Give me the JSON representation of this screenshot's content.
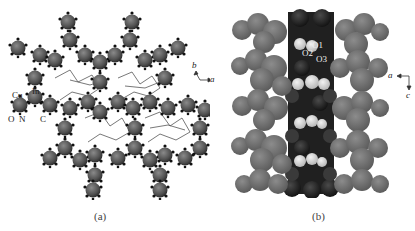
{
  "figure": {
    "panels": [
      {
        "id": "a",
        "caption": "(a)",
        "atom_labels": [
          "Cu",
          "In",
          "O",
          "N",
          "C"
        ],
        "axes": {
          "up": "b",
          "right": "a"
        }
      },
      {
        "id": "b",
        "caption": "(b)",
        "atom_labels": [
          "O1",
          "O2",
          "O3"
        ],
        "axes": {
          "left": "a",
          "down": "c"
        }
      }
    ]
  },
  "colors": {
    "framework_dark": "#4a4a4a",
    "framework_mid": "#6a6a6a",
    "sphere_gray": "#707070",
    "channel_dark": "#1e1e1e",
    "channel_light": "#d8d8d8",
    "background": "#ffffff"
  }
}
